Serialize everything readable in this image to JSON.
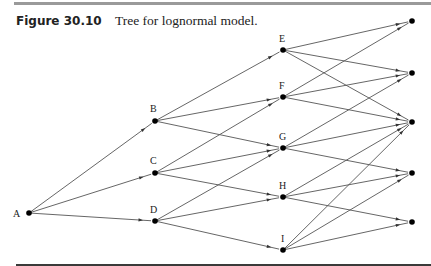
{
  "figure": {
    "number": "Figure 30.10",
    "caption": "Tree for lognormal model."
  },
  "diagram": {
    "type": "lognormal-tree",
    "nodes": [
      {
        "id": "A",
        "label": "A",
        "x": 29,
        "y": 213,
        "lx": 13,
        "ly": 217
      },
      {
        "id": "B",
        "label": "B",
        "x": 155,
        "y": 121,
        "lx": 150,
        "ly": 112
      },
      {
        "id": "C",
        "label": "C",
        "x": 155,
        "y": 173,
        "lx": 150,
        "ly": 164
      },
      {
        "id": "D",
        "label": "D",
        "x": 155,
        "y": 221,
        "lx": 150,
        "ly": 213
      },
      {
        "id": "E",
        "label": "E",
        "x": 283,
        "y": 50,
        "lx": 279,
        "ly": 42
      },
      {
        "id": "F",
        "label": "F",
        "x": 283,
        "y": 97,
        "lx": 279,
        "ly": 89
      },
      {
        "id": "G",
        "label": "G",
        "x": 283,
        "y": 148,
        "lx": 279,
        "ly": 140
      },
      {
        "id": "H",
        "label": "H",
        "x": 283,
        "y": 197,
        "lx": 279,
        "ly": 189
      },
      {
        "id": "I",
        "label": "I",
        "x": 283,
        "y": 250,
        "lx": 281,
        "ly": 242
      },
      {
        "id": "T1",
        "label": "",
        "x": 412,
        "y": 21
      },
      {
        "id": "T2",
        "label": "",
        "x": 412,
        "y": 73
      },
      {
        "id": "T3",
        "label": "",
        "x": 412,
        "y": 122
      },
      {
        "id": "T4",
        "label": "",
        "x": 412,
        "y": 173
      },
      {
        "id": "T5",
        "label": "",
        "x": 412,
        "y": 222
      }
    ],
    "edges": [
      [
        "A",
        "B"
      ],
      [
        "A",
        "C"
      ],
      [
        "A",
        "D"
      ],
      [
        "B",
        "E"
      ],
      [
        "B",
        "F"
      ],
      [
        "B",
        "G"
      ],
      [
        "C",
        "F"
      ],
      [
        "C",
        "G"
      ],
      [
        "C",
        "H"
      ],
      [
        "D",
        "G"
      ],
      [
        "D",
        "H"
      ],
      [
        "D",
        "I"
      ],
      [
        "E",
        "T1"
      ],
      [
        "E",
        "T2"
      ],
      [
        "E",
        "T3"
      ],
      [
        "F",
        "T1"
      ],
      [
        "F",
        "T2"
      ],
      [
        "F",
        "T3"
      ],
      [
        "G",
        "T2"
      ],
      [
        "G",
        "T3"
      ],
      [
        "G",
        "T4"
      ],
      [
        "H",
        "T3"
      ],
      [
        "H",
        "T4"
      ],
      [
        "H",
        "T5"
      ],
      [
        "I",
        "T3"
      ],
      [
        "I",
        "T4"
      ],
      [
        "I",
        "T5"
      ]
    ],
    "colors": {
      "edge": "#555555",
      "node": "#000000",
      "rule_top": "#9a9a9a",
      "rule_bottom": "#3a3a3a"
    }
  }
}
